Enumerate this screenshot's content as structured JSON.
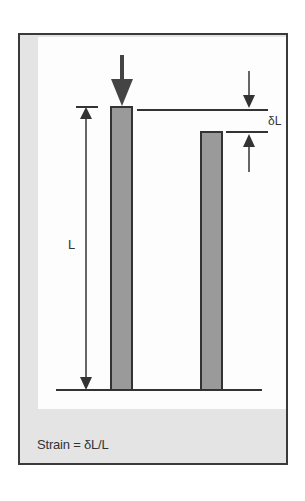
{
  "diagram": {
    "type": "strain-illustration",
    "labels": {
      "length": "L",
      "delta_length": "δL"
    },
    "caption": "Strain = δL/L",
    "colors": {
      "bar_fill": "#9a9a9a",
      "bar_stroke": "#333333",
      "frame_border": "#3a3a3a",
      "panel_bg": "#e4e4e4",
      "inner_bg": "#fdfdfd"
    },
    "elements": {
      "original_bar": {
        "label": "original bar",
        "top_y": 107,
        "bottom_y": 390
      },
      "compressed_bar": {
        "label": "compressed bar",
        "top_y": 132,
        "bottom_y": 390
      },
      "load_arrow": {
        "label": "applied compressive load",
        "direction": "down"
      }
    }
  }
}
